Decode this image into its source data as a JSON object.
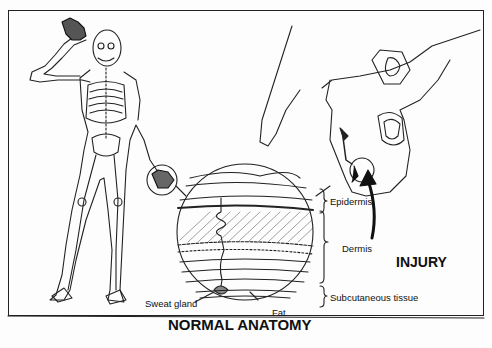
{
  "figure": {
    "title": "NORMAL ANATOMY",
    "injury_label": "INJURY",
    "layers": [
      {
        "label": "Epidermis"
      },
      {
        "label": "Dermis"
      },
      {
        "label": "Subcutaneous tissue"
      }
    ],
    "callouts": {
      "sweat_gland": "Sweat gland",
      "fat": "Fat"
    },
    "colors": {
      "ink": "#111111",
      "paper": "#fdfdfd"
    }
  }
}
